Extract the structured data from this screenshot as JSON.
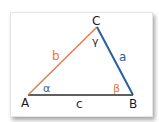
{
  "diagram": {
    "type": "triangle",
    "vertices": [
      {
        "label": "A",
        "x": 28,
        "y": 95
      },
      {
        "label": "B",
        "x": 133,
        "y": 95
      },
      {
        "label": "C",
        "x": 97,
        "y": 27
      }
    ],
    "sides": {
      "a": {
        "label": "a",
        "color": "#2b5ea7"
      },
      "b": {
        "label": "b",
        "color": "#e07a4a"
      },
      "c": {
        "label": "c",
        "color": "#2a2a2a"
      }
    },
    "angles": {
      "alpha": {
        "label": "α",
        "color": "#2b5ea7"
      },
      "beta": {
        "label": "β",
        "color": "#e07a4a"
      },
      "gamma": {
        "label": "γ",
        "color": "#2a2a2a"
      }
    }
  }
}
